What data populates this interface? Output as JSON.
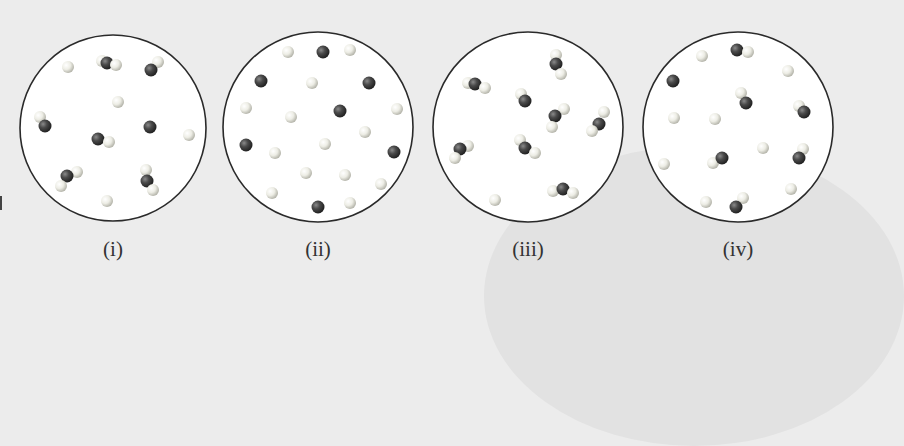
{
  "colors": {
    "background": "#ececec",
    "circle_fill": "#ffffff",
    "circle_stroke": "#2a2a2a",
    "dark_atom": "#3a3a3a",
    "light_atom": "#e8e8e0"
  },
  "panels": [
    {
      "label": "(i)",
      "cx": 113,
      "cy": 128,
      "r": 93,
      "atoms": [
        {
          "t": "L",
          "x": 68,
          "y": 67
        },
        {
          "t": "L",
          "x": 102,
          "y": 61
        },
        {
          "t": "D",
          "x": 107,
          "y": 63
        },
        {
          "t": "L",
          "x": 116,
          "y": 65
        },
        {
          "t": "L",
          "x": 158,
          "y": 62
        },
        {
          "t": "D",
          "x": 151,
          "y": 70
        },
        {
          "t": "L",
          "x": 118,
          "y": 102
        },
        {
          "t": "L",
          "x": 40,
          "y": 117
        },
        {
          "t": "D",
          "x": 45,
          "y": 126
        },
        {
          "t": "D",
          "x": 98,
          "y": 139
        },
        {
          "t": "L",
          "x": 109,
          "y": 142
        },
        {
          "t": "D",
          "x": 150,
          "y": 127
        },
        {
          "t": "L",
          "x": 189,
          "y": 135
        },
        {
          "t": "L",
          "x": 77,
          "y": 172
        },
        {
          "t": "D",
          "x": 67,
          "y": 176
        },
        {
          "t": "L",
          "x": 61,
          "y": 186
        },
        {
          "t": "L",
          "x": 146,
          "y": 170
        },
        {
          "t": "D",
          "x": 147,
          "y": 181
        },
        {
          "t": "L",
          "x": 153,
          "y": 190
        },
        {
          "t": "L",
          "x": 107,
          "y": 201
        }
      ]
    },
    {
      "label": "(ii)",
      "cx": 318,
      "cy": 127,
      "r": 95,
      "atoms": [
        {
          "t": "L",
          "x": 288,
          "y": 52
        },
        {
          "t": "D",
          "x": 323,
          "y": 52
        },
        {
          "t": "L",
          "x": 350,
          "y": 50
        },
        {
          "t": "D",
          "x": 261,
          "y": 81
        },
        {
          "t": "L",
          "x": 312,
          "y": 83
        },
        {
          "t": "D",
          "x": 369,
          "y": 83
        },
        {
          "t": "L",
          "x": 246,
          "y": 108
        },
        {
          "t": "L",
          "x": 291,
          "y": 117
        },
        {
          "t": "D",
          "x": 340,
          "y": 111
        },
        {
          "t": "L",
          "x": 397,
          "y": 109
        },
        {
          "t": "L",
          "x": 365,
          "y": 132
        },
        {
          "t": "D",
          "x": 246,
          "y": 145
        },
        {
          "t": "L",
          "x": 275,
          "y": 153
        },
        {
          "t": "L",
          "x": 325,
          "y": 144
        },
        {
          "t": "D",
          "x": 394,
          "y": 152
        },
        {
          "t": "L",
          "x": 306,
          "y": 173
        },
        {
          "t": "L",
          "x": 345,
          "y": 175
        },
        {
          "t": "L",
          "x": 381,
          "y": 184
        },
        {
          "t": "L",
          "x": 272,
          "y": 193
        },
        {
          "t": "D",
          "x": 318,
          "y": 207
        },
        {
          "t": "L",
          "x": 350,
          "y": 203
        }
      ]
    },
    {
      "label": "(iii)",
      "cx": 528,
      "cy": 127,
      "r": 95,
      "atoms": [
        {
          "t": "L",
          "x": 556,
          "y": 55
        },
        {
          "t": "D",
          "x": 556,
          "y": 64
        },
        {
          "t": "L",
          "x": 561,
          "y": 74
        },
        {
          "t": "L",
          "x": 468,
          "y": 83
        },
        {
          "t": "D",
          "x": 475,
          "y": 84
        },
        {
          "t": "L",
          "x": 485,
          "y": 88
        },
        {
          "t": "L",
          "x": 521,
          "y": 94
        },
        {
          "t": "D",
          "x": 525,
          "y": 101
        },
        {
          "t": "L",
          "x": 564,
          "y": 109
        },
        {
          "t": "D",
          "x": 555,
          "y": 116
        },
        {
          "t": "L",
          "x": 552,
          "y": 127
        },
        {
          "t": "L",
          "x": 604,
          "y": 112
        },
        {
          "t": "D",
          "x": 599,
          "y": 124
        },
        {
          "t": "L",
          "x": 592,
          "y": 131
        },
        {
          "t": "L",
          "x": 468,
          "y": 146
        },
        {
          "t": "D",
          "x": 460,
          "y": 149
        },
        {
          "t": "L",
          "x": 455,
          "y": 158
        },
        {
          "t": "L",
          "x": 520,
          "y": 140
        },
        {
          "t": "D",
          "x": 525,
          "y": 148
        },
        {
          "t": "L",
          "x": 535,
          "y": 153
        },
        {
          "t": "L",
          "x": 495,
          "y": 200
        },
        {
          "t": "L",
          "x": 553,
          "y": 191
        },
        {
          "t": "D",
          "x": 563,
          "y": 189
        },
        {
          "t": "L",
          "x": 573,
          "y": 193
        }
      ]
    },
    {
      "label": "(iv)",
      "cx": 738,
      "cy": 127,
      "r": 95,
      "atoms": [
        {
          "t": "L",
          "x": 702,
          "y": 56
        },
        {
          "t": "D",
          "x": 737,
          "y": 50
        },
        {
          "t": "L",
          "x": 748,
          "y": 52
        },
        {
          "t": "L",
          "x": 788,
          "y": 71
        },
        {
          "t": "D",
          "x": 673,
          "y": 81
        },
        {
          "t": "L",
          "x": 741,
          "y": 93
        },
        {
          "t": "D",
          "x": 746,
          "y": 103
        },
        {
          "t": "L",
          "x": 799,
          "y": 106
        },
        {
          "t": "D",
          "x": 804,
          "y": 112
        },
        {
          "t": "L",
          "x": 674,
          "y": 118
        },
        {
          "t": "L",
          "x": 715,
          "y": 119
        },
        {
          "t": "L",
          "x": 763,
          "y": 148
        },
        {
          "t": "L",
          "x": 803,
          "y": 149
        },
        {
          "t": "D",
          "x": 799,
          "y": 158
        },
        {
          "t": "L",
          "x": 664,
          "y": 164
        },
        {
          "t": "L",
          "x": 713,
          "y": 163
        },
        {
          "t": "D",
          "x": 722,
          "y": 158
        },
        {
          "t": "L",
          "x": 791,
          "y": 189
        },
        {
          "t": "L",
          "x": 706,
          "y": 202
        },
        {
          "t": "L",
          "x": 743,
          "y": 198
        },
        {
          "t": "D",
          "x": 736,
          "y": 207
        }
      ]
    }
  ]
}
